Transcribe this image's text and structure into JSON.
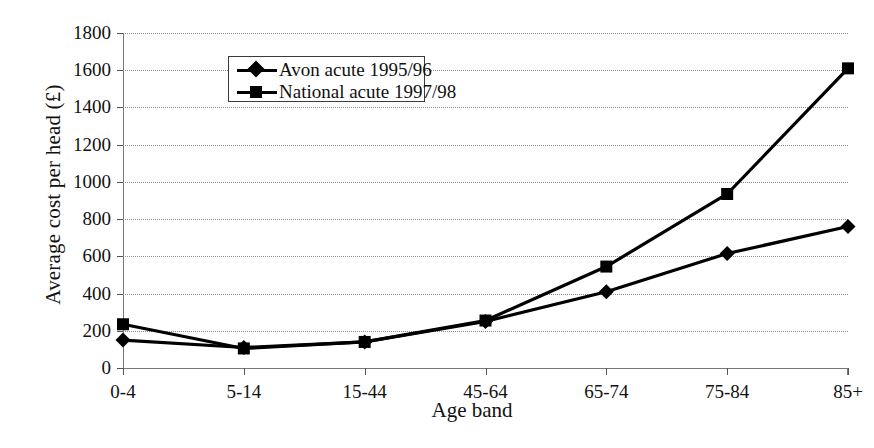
{
  "chart_data": {
    "type": "line",
    "title": "",
    "xlabel": "Age band",
    "ylabel": "Average cost per head (£)",
    "categories": [
      "0-4",
      "5-14",
      "15-44",
      "45-64",
      "65-74",
      "75-84",
      "85+"
    ],
    "ylim": [
      0,
      1800
    ],
    "ytick_step": 200,
    "yticks": [
      0,
      200,
      400,
      600,
      800,
      1000,
      1200,
      1400,
      1600,
      1800
    ],
    "ytick_labels": [
      "0",
      "200",
      "400",
      "600",
      "800",
      "1000",
      "1200",
      "1400",
      "1600",
      "1800"
    ],
    "grid": true,
    "grid_style": "dotted",
    "legend_position": "top-left-inside",
    "series": [
      {
        "name": "Avon acute 1995/96",
        "marker": "diamond",
        "color": "#000000",
        "values": [
          150,
          110,
          140,
          250,
          410,
          615,
          760
        ]
      },
      {
        "name": "National acute 1997/98",
        "marker": "square",
        "color": "#000000",
        "values": [
          235,
          105,
          140,
          255,
          545,
          935,
          1610
        ]
      }
    ]
  },
  "colors": {
    "axis": "#777777",
    "grid": "#8a8a8a",
    "ink": "#000000",
    "background": "#ffffff"
  }
}
